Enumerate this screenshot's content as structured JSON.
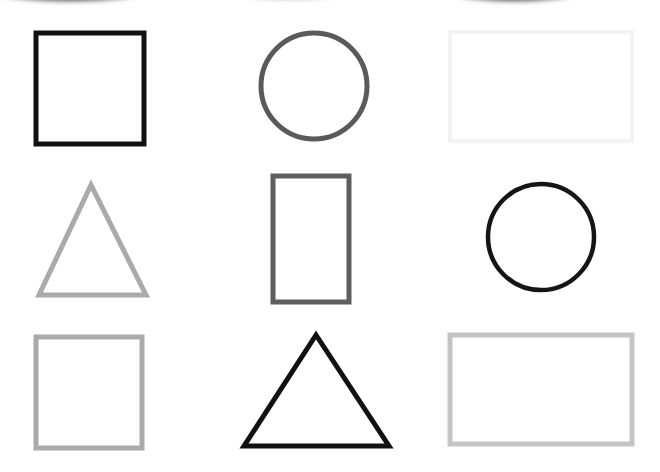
{
  "grid": {
    "rows": 3,
    "cols": 3
  },
  "shapes": [
    {
      "name": "square-black",
      "type": "square",
      "color": "#111111",
      "row": 1,
      "col": 1
    },
    {
      "name": "circle-dark-gray",
      "type": "circle",
      "color": "#5a5a5a",
      "row": 1,
      "col": 2
    },
    {
      "name": "rectangle-very-light-gray",
      "type": "rectangle",
      "color": "#f3f3f3",
      "row": 1,
      "col": 3
    },
    {
      "name": "triangle-light-gray",
      "type": "triangle",
      "color": "#aaaaaa",
      "row": 2,
      "col": 1
    },
    {
      "name": "rectangle-tall-dark-gray",
      "type": "rectangle-vertical",
      "color": "#5e5e5e",
      "row": 2,
      "col": 2
    },
    {
      "name": "circle-black",
      "type": "circle",
      "color": "#151515",
      "row": 2,
      "col": 3
    },
    {
      "name": "square-light-gray",
      "type": "square",
      "color": "#aaaaaa",
      "row": 3,
      "col": 1
    },
    {
      "name": "triangle-black",
      "type": "triangle",
      "color": "#111111",
      "row": 3,
      "col": 2
    },
    {
      "name": "rectangle-light-gray",
      "type": "rectangle",
      "color": "#c4c4c4",
      "row": 3,
      "col": 3
    }
  ],
  "top_edge_shadows": [
    {
      "name": "cropped-shape-left",
      "color": "#555555"
    },
    {
      "name": "cropped-shape-middle",
      "color": "#777777"
    },
    {
      "name": "cropped-shape-right",
      "color": "#555555"
    }
  ]
}
